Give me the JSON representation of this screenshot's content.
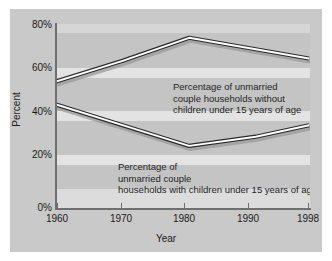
{
  "chart_data": {
    "type": "line",
    "title": "",
    "subtitle": "",
    "xlabel": "Year",
    "ylabel": "Percent",
    "x": [
      1960,
      1970,
      1980,
      1990,
      1998
    ],
    "xtick_labels": [
      "1960",
      "1970",
      "1980",
      "1990",
      "1998"
    ],
    "ytick_labels": [
      "0%",
      "20%",
      "40%",
      "60%",
      "80%"
    ],
    "ytick_values": [
      0,
      20,
      40,
      60,
      80
    ],
    "xlim": [
      1960,
      1998
    ],
    "ylim": [
      0,
      80
    ],
    "grid": true,
    "legend_position": "inline-annotations",
    "series": [
      {
        "name": "Percentage of unmarried couple households without children under 15 years of age",
        "values": [
          55,
          64,
          74,
          69,
          65
        ],
        "color": "#2b2b2b"
      },
      {
        "name": "Percentage of unmarried couple households with children under 15 years of age",
        "values": [
          45,
          36,
          27,
          31,
          36
        ],
        "color": "#2b2b2b"
      }
    ],
    "annotations": [
      {
        "id": "upper",
        "lines": [
          "Percentage of unmarried",
          "couple households without",
          "children under 15 years of age"
        ]
      },
      {
        "id": "lower",
        "lines": [
          "Percentage of",
          "unmarried couple",
          "households with children under 15 years of age"
        ]
      }
    ],
    "colors": {
      "figure_background": "#ffffff",
      "panel_background": "#c9c9c9",
      "plot_background": "#c4c4c4",
      "gridband": "#e3e3e3",
      "axis": "#6f6f6f",
      "line": "#2b2b2b",
      "line_highlight": "#ffffff",
      "line_shadow": "#9a9a9a",
      "text": "#1a1a1a"
    }
  },
  "axis": {
    "y": {
      "title": "Percent",
      "ticks": [
        {
          "label": "80%",
          "top": 20
        },
        {
          "label": "60%",
          "top": 63
        },
        {
          "label": "40%",
          "top": 107
        },
        {
          "label": "20%",
          "top": 150
        },
        {
          "label": "0%",
          "top": 203
        }
      ]
    },
    "x": {
      "title": "Year",
      "ticks": [
        {
          "label": "1960",
          "left": 57
        },
        {
          "label": "1970",
          "left": 121
        },
        {
          "label": "1980",
          "left": 184
        },
        {
          "label": "1990",
          "left": 248
        },
        {
          "label": "1998",
          "left": 308
        }
      ]
    }
  },
  "annotations": {
    "upper": {
      "line1": "Percentage of unmarried",
      "line2": "couple households without",
      "line3": "children under 15 years of age"
    },
    "lower": {
      "line1": "Percentage of",
      "line2": "unmarried couple",
      "line3": "households with children under 15 years of age"
    }
  }
}
